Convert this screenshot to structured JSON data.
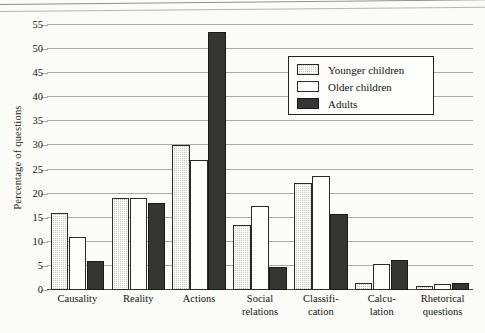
{
  "chart_data": {
    "type": "bar",
    "title": "",
    "xlabel": "",
    "ylabel": "Percentage of questions",
    "ylim": [
      0,
      55
    ],
    "ytick_step": 5,
    "yticks": [
      "0",
      "5",
      "10",
      "15",
      "20",
      "25",
      "30",
      "35",
      "40",
      "45",
      "50",
      "55"
    ],
    "grid": true,
    "legend_position": "upper-right-inside",
    "categories": [
      "Causality",
      "Reality",
      "Actions",
      "Social relations",
      "Classification",
      "Calculation",
      "Rhetorical questions"
    ],
    "category_lines": [
      [
        "Causality"
      ],
      [
        "Reality"
      ],
      [
        "Actions"
      ],
      [
        "Social",
        "relations"
      ],
      [
        "Classifi-",
        "cation"
      ],
      [
        "Calcu-",
        "lation"
      ],
      [
        "Rhetorical",
        "questions"
      ]
    ],
    "series": [
      {
        "name": "Younger children",
        "color": "#c9c9c4",
        "values": [
          16.0,
          19.2,
          30.2,
          13.5,
          22.3,
          1.5,
          0.8
        ]
      },
      {
        "name": "Older children",
        "color": "#fdfdfb",
        "values": [
          11.0,
          19.0,
          27.0,
          17.5,
          23.7,
          5.5,
          1.3
        ]
      },
      {
        "name": "Adults",
        "color": "#353532",
        "values": [
          6.0,
          18.0,
          53.5,
          4.7,
          15.7,
          6.2,
          1.4
        ]
      }
    ]
  }
}
